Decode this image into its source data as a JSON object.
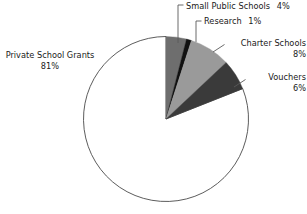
{
  "chart_data": {
    "type": "pie",
    "title": "",
    "categories": [
      "Private School Grants",
      "Small Public Schools",
      "Research",
      "Charter Schools",
      "Vouchers"
    ],
    "values": [
      81,
      4,
      1,
      8,
      6
    ],
    "value_labels": [
      "81%",
      "4%",
      "1%",
      "8%",
      "6%"
    ],
    "unit": "%",
    "start_angle_deg": 0,
    "direction": "clockwise",
    "legend": "none",
    "grid": false,
    "slices": [
      {
        "name": "Small Public Schools",
        "label": "Small Public Schools",
        "percent": 4,
        "percent_label": "4%",
        "color": "#6e6e6e",
        "start_deg": 0,
        "end_deg": 14.4,
        "leader": "vertical"
      },
      {
        "name": "Research",
        "label": "Research",
        "percent": 1,
        "percent_label": "1%",
        "color": "#111111",
        "start_deg": 14.4,
        "end_deg": 18.0,
        "leader": "vertical"
      },
      {
        "name": "Charter Schools",
        "label": "Charter Schools",
        "percent": 8,
        "percent_label": "8%",
        "color": "#9a9a9a",
        "start_deg": 18.0,
        "end_deg": 46.8,
        "leader": "diagonal"
      },
      {
        "name": "Vouchers",
        "label": "Vouchers",
        "percent": 6,
        "percent_label": "6%",
        "color": "#3a3a3a",
        "start_deg": 46.8,
        "end_deg": 68.4,
        "leader": "diagonal"
      },
      {
        "name": "Private School Grants",
        "label": "Private School Grants",
        "percent": 81,
        "percent_label": "81%",
        "color": "#ffffff",
        "stroke": "#4a4a4a",
        "start_deg": 68.4,
        "end_deg": 360,
        "leader": "none"
      }
    ]
  },
  "labels": {
    "small_public_schools": {
      "name": "Small Public Schools",
      "percent": "4%"
    },
    "research": {
      "name": "Research",
      "percent": "1%"
    },
    "charter_schools": {
      "name": "Charter Schools",
      "percent": "8%"
    },
    "vouchers": {
      "name": "Vouchers",
      "percent": "6%"
    },
    "private_school_grants": {
      "name": "Private School Grants",
      "percent": "81%"
    }
  }
}
